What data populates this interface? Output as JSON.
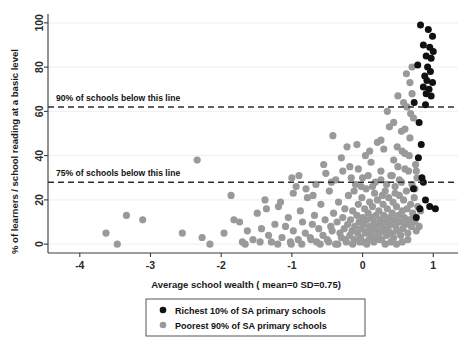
{
  "chart_data": {
    "type": "scatter",
    "title": "",
    "xlabel": "Average school wealth ( mean=0  SD=0.75)",
    "ylabel": "% of learners / school reading at a basic level",
    "xlim": [
      -4.45,
      1.35
    ],
    "ylim": [
      -4,
      104
    ],
    "xticks": [
      -4,
      -3,
      -2,
      -1,
      0,
      1
    ],
    "xtick_labels": [
      "-4",
      "-3",
      "-2",
      "-1",
      "0",
      "1"
    ],
    "yticks": [
      0,
      20,
      40,
      60,
      80,
      100
    ],
    "ytick_labels": [
      "0",
      "20",
      "40",
      "60",
      "80",
      "100"
    ],
    "grid": "horizontal-faint",
    "legend_position": "below-axis-center",
    "annotations": [
      {
        "name": "p90-line",
        "text": "90% of schools below this line",
        "y": 62,
        "style": "dashed",
        "color": "#2e2e2e"
      },
      {
        "name": "p75-line",
        "text": "75% of schools below this line",
        "y": 28,
        "style": "dashed",
        "color": "#2e2e2e"
      }
    ],
    "series": [
      {
        "name": "Richest 10% of SA primary schools",
        "color": "#111111",
        "marker": "circle",
        "points": [
          [
            0.82,
            99
          ],
          [
            0.93,
            97
          ],
          [
            0.99,
            94
          ],
          [
            0.86,
            90
          ],
          [
            0.95,
            89
          ],
          [
            1.0,
            87
          ],
          [
            0.9,
            85
          ],
          [
            0.97,
            84
          ],
          [
            0.78,
            81
          ],
          [
            0.92,
            80
          ],
          [
            0.96,
            78
          ],
          [
            0.88,
            76
          ],
          [
            0.91,
            74
          ],
          [
            0.99,
            73
          ],
          [
            0.86,
            71
          ],
          [
            0.94,
            70
          ],
          [
            0.9,
            68
          ],
          [
            0.97,
            67
          ],
          [
            0.73,
            64
          ],
          [
            0.89,
            63
          ],
          [
            0.8,
            55
          ],
          [
            0.83,
            45
          ],
          [
            0.79,
            39
          ],
          [
            0.84,
            30
          ],
          [
            0.86,
            28
          ],
          [
            0.72,
            25
          ],
          [
            0.89,
            20
          ],
          [
            0.95,
            17
          ],
          [
            0.81,
            16
          ],
          [
            1.03,
            16
          ],
          [
            0.76,
            12
          ]
        ]
      },
      {
        "name": "Poorest 90% of SA primary schools",
        "color": "#9a9a9a",
        "marker": "circle",
        "points": [
          [
            -3.63,
            5
          ],
          [
            -3.47,
            0
          ],
          [
            -3.34,
            13
          ],
          [
            -3.11,
            11
          ],
          [
            -2.55,
            5
          ],
          [
            -2.34,
            38
          ],
          [
            -2.27,
            3
          ],
          [
            -2.16,
            0
          ],
          [
            -1.96,
            5
          ],
          [
            -1.86,
            22
          ],
          [
            -1.82,
            11
          ],
          [
            -1.74,
            10
          ],
          [
            -1.7,
            1
          ],
          [
            -1.63,
            6
          ],
          [
            -1.55,
            2
          ],
          [
            -1.49,
            14
          ],
          [
            -1.43,
            7
          ],
          [
            -1.38,
            20
          ],
          [
            -1.33,
            4
          ],
          [
            -1.29,
            1
          ],
          [
            -1.24,
            9
          ],
          [
            -1.19,
            17
          ],
          [
            -1.14,
            3
          ],
          [
            -1.09,
            8
          ],
          [
            -1.05,
            12
          ],
          [
            -1.01,
            0
          ],
          [
            -0.98,
            6
          ],
          [
            -0.94,
            26
          ],
          [
            -0.91,
            2
          ],
          [
            -0.88,
            15
          ],
          [
            -0.85,
            10
          ],
          [
            -0.81,
            5
          ],
          [
            -0.78,
            21
          ],
          [
            -0.74,
            3
          ],
          [
            -0.71,
            9
          ],
          [
            -0.68,
            13
          ],
          [
            -0.65,
            1
          ],
          [
            -0.62,
            7
          ],
          [
            -0.59,
            18
          ],
          [
            -0.56,
            4
          ],
          [
            -0.53,
            11
          ],
          [
            -0.5,
            2
          ],
          [
            -0.47,
            24
          ],
          [
            -0.45,
            8
          ],
          [
            -0.43,
            6
          ],
          [
            -0.41,
            14
          ],
          [
            -0.38,
            0
          ],
          [
            -0.36,
            10
          ],
          [
            -0.34,
            19
          ],
          [
            -0.32,
            5
          ],
          [
            -0.3,
            3
          ],
          [
            -0.28,
            12
          ],
          [
            -0.26,
            7
          ],
          [
            -0.25,
            16
          ],
          [
            -0.23,
            1
          ],
          [
            -0.21,
            9
          ],
          [
            -0.2,
            22
          ],
          [
            -0.18,
            4
          ],
          [
            -0.17,
            11
          ],
          [
            -0.15,
            6
          ],
          [
            -0.14,
            15
          ],
          [
            -0.12,
            2
          ],
          [
            -0.11,
            8
          ],
          [
            -0.1,
            27
          ],
          [
            -0.08,
            13
          ],
          [
            -0.07,
            5
          ],
          [
            -0.06,
            18
          ],
          [
            -0.05,
            10
          ],
          [
            -0.03,
            3
          ],
          [
            -0.02,
            7
          ],
          [
            -0.01,
            21
          ],
          [
            0.0,
            12
          ],
          [
            0.01,
            1
          ],
          [
            0.02,
            9
          ],
          [
            0.03,
            16
          ],
          [
            0.04,
            5
          ],
          [
            0.05,
            25
          ],
          [
            0.06,
            11
          ],
          [
            0.07,
            6
          ],
          [
            0.08,
            14
          ],
          [
            0.09,
            2
          ],
          [
            0.1,
            19
          ],
          [
            0.11,
            8
          ],
          [
            0.12,
            4
          ],
          [
            0.13,
            12
          ],
          [
            0.14,
            17
          ],
          [
            0.15,
            7
          ],
          [
            0.16,
            10
          ],
          [
            0.17,
            23
          ],
          [
            0.18,
            3
          ],
          [
            0.19,
            13
          ],
          [
            0.2,
            6
          ],
          [
            0.21,
            20
          ],
          [
            0.22,
            9
          ],
          [
            0.23,
            15
          ],
          [
            0.24,
            5
          ],
          [
            0.25,
            11
          ],
          [
            0.26,
            29
          ],
          [
            0.27,
            2
          ],
          [
            0.28,
            8
          ],
          [
            0.29,
            18
          ],
          [
            0.3,
            13
          ],
          [
            0.31,
            6
          ],
          [
            0.32,
            24
          ],
          [
            0.33,
            10
          ],
          [
            0.34,
            4
          ],
          [
            0.35,
            16
          ],
          [
            0.36,
            7
          ],
          [
            0.37,
            21
          ],
          [
            0.38,
            12
          ],
          [
            0.39,
            9
          ],
          [
            0.4,
            31
          ],
          [
            0.41,
            5
          ],
          [
            0.42,
            14
          ],
          [
            0.43,
            19
          ],
          [
            0.44,
            3
          ],
          [
            0.45,
            11
          ],
          [
            0.46,
            26
          ],
          [
            0.47,
            8
          ],
          [
            0.48,
            17
          ],
          [
            0.49,
            6
          ],
          [
            0.5,
            35
          ],
          [
            0.51,
            13
          ],
          [
            0.52,
            22
          ],
          [
            0.53,
            10
          ],
          [
            0.54,
            4
          ],
          [
            0.55,
            28
          ],
          [
            0.56,
            15
          ],
          [
            0.57,
            7
          ],
          [
            0.58,
            20
          ],
          [
            0.59,
            12
          ],
          [
            0.6,
            41
          ],
          [
            0.61,
            9
          ],
          [
            0.62,
            24
          ],
          [
            0.63,
            16
          ],
          [
            0.64,
            5
          ],
          [
            0.65,
            33
          ],
          [
            0.66,
            11
          ],
          [
            0.67,
            48
          ],
          [
            0.68,
            18
          ],
          [
            0.69,
            8
          ],
          [
            0.7,
            27
          ],
          [
            0.71,
            14
          ],
          [
            0.72,
            57
          ],
          [
            0.73,
            21
          ],
          [
            0.74,
            10
          ],
          [
            0.75,
            36
          ],
          [
            0.76,
            6
          ],
          [
            0.77,
            30
          ],
          [
            0.78,
            17
          ],
          [
            0.58,
            64
          ],
          [
            0.63,
            62
          ],
          [
            0.55,
            51
          ],
          [
            0.49,
            44
          ],
          [
            0.44,
            38
          ],
          [
            0.38,
            53
          ],
          [
            0.3,
            43
          ],
          [
            0.21,
            46
          ],
          [
            0.12,
            37
          ],
          [
            0.04,
            40
          ],
          [
            -0.06,
            34
          ],
          [
            -0.16,
            30
          ],
          [
            -0.28,
            33
          ],
          [
            -0.38,
            29
          ],
          [
            -0.52,
            32
          ],
          [
            -0.66,
            27
          ],
          [
            -0.8,
            25
          ],
          [
            -0.98,
            23
          ],
          [
            -1.16,
            19
          ],
          [
            -1.36,
            16
          ],
          [
            -0.42,
            49
          ],
          [
            -0.22,
            44
          ],
          [
            0.68,
            59
          ],
          [
            0.7,
            68
          ],
          [
            0.66,
            40
          ],
          [
            0.6,
            34
          ],
          [
            0.52,
            29
          ],
          [
            0.46,
            23
          ],
          [
            0.34,
            27
          ],
          [
            0.26,
            33
          ],
          [
            0.18,
            28
          ],
          [
            0.08,
            31
          ],
          [
            -0.02,
            26
          ],
          [
            -0.12,
            24
          ],
          [
            0.74,
            25
          ],
          [
            0.76,
            33
          ],
          [
            0.72,
            12
          ],
          [
            0.64,
            2
          ],
          [
            0.56,
            1
          ],
          [
            0.48,
            0
          ],
          [
            0.4,
            1
          ],
          [
            0.32,
            0
          ],
          [
            0.24,
            2
          ],
          [
            0.16,
            1
          ],
          [
            0.06,
            0
          ],
          [
            -0.04,
            1
          ],
          [
            -0.14,
            0
          ],
          [
            -0.24,
            2
          ],
          [
            -0.35,
            0
          ],
          [
            -0.48,
            1
          ],
          [
            -0.6,
            0
          ],
          [
            -0.73,
            2
          ],
          [
            -0.86,
            0
          ],
          [
            -1.02,
            1
          ],
          [
            -1.2,
            0
          ],
          [
            -1.45,
            1
          ],
          [
            -1.66,
            0
          ],
          [
            0.8,
            8
          ],
          [
            0.82,
            15
          ],
          [
            0.6,
            52
          ],
          [
            0.44,
            55
          ],
          [
            0.26,
            47
          ],
          [
            0.1,
            42
          ],
          [
            -0.08,
            45
          ],
          [
            -0.3,
            39
          ],
          [
            -0.55,
            36
          ],
          [
            -0.9,
            31
          ],
          [
            0.35,
            60
          ],
          [
            0.5,
            67
          ],
          [
            0.67,
            73
          ],
          [
            0.62,
            77
          ],
          [
            0.7,
            80
          ],
          [
            0.56,
            42
          ],
          [
            0.42,
            31
          ],
          [
            0.28,
            22
          ],
          [
            0.14,
            26
          ],
          [
            0.0,
            30
          ],
          [
            -0.18,
            35
          ],
          [
            -0.44,
            28
          ],
          [
            -0.7,
            22
          ],
          [
            -1.0,
            30
          ]
        ]
      }
    ]
  },
  "axis": {
    "x_title": "Average school wealth ( mean=0  SD=0.75)",
    "y_title": "% of learners / school reading at a basic level"
  },
  "legend": {
    "items": [
      {
        "label": "Richest 10% of SA primary schools",
        "color": "#111111"
      },
      {
        "label": "Poorest 90% of SA primary schools",
        "color": "#9a9a9a"
      }
    ]
  },
  "colors": {
    "rich": "#111111",
    "poor": "#9a9a9a",
    "axis": "#3a3a3a",
    "grid": "#f2f2f2",
    "dash": "#2e2e2e",
    "background": "#ffffff"
  }
}
